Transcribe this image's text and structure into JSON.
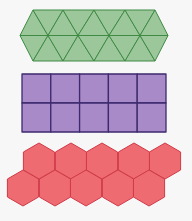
{
  "background": "#f6f7f6",
  "tessellations": [
    {
      "name": "triangles",
      "shape": "equilateral-triangle",
      "rows": 2,
      "fill": "#9cc79a",
      "stroke": "#3f8a45",
      "top_x": [
        33,
        63,
        94,
        125,
        155
      ],
      "mid_x": [
        20,
        48,
        78,
        109,
        140,
        168
      ],
      "y_top": 10,
      "y_mid": 35.5,
      "y_bot": 61
    },
    {
      "name": "squares",
      "shape": "square",
      "rows": 2,
      "cols": 5,
      "fill": "#a98ac8",
      "stroke": "#3d2a6e",
      "x": 22,
      "y": 74,
      "cell": 28.8,
      "cell_h": 29
    },
    {
      "name": "hexagons",
      "shape": "regular-hexagon",
      "fill": "#ee6b72",
      "stroke": "#d03a48",
      "radius": 18,
      "rows": [
        {
          "cy": 161,
          "cx": [
            39,
            71,
            102,
            134,
            165
          ]
        },
        {
          "cy": 188,
          "cx": [
            23,
            55,
            86,
            118,
            149
          ]
        }
      ]
    }
  ]
}
